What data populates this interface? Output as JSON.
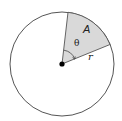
{
  "diagram": {
    "type": "circle-sector",
    "labels": {
      "area": "A",
      "angle": "θ",
      "radius": "r"
    },
    "colors": {
      "background": "#ffffff",
      "circle_stroke": "#555555",
      "sector_fill": "#d9d9d9",
      "sector_stroke": "#555555",
      "center_dot": "#000000",
      "label_text": "#222222"
    }
  }
}
